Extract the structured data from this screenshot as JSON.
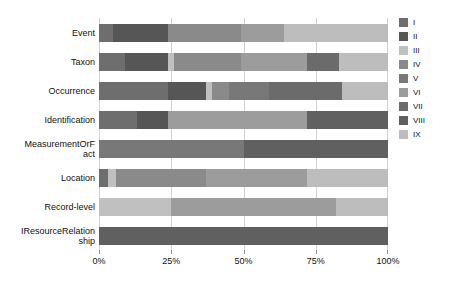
{
  "chart_data": {
    "type": "bar",
    "orientation": "horizontal",
    "stacked": true,
    "normalized": true,
    "title": "",
    "subtitle": "",
    "xlabel": "",
    "ylabel": "",
    "xlim": [
      0,
      100
    ],
    "grid": true,
    "legend_position": "right",
    "xticks": [
      0,
      25,
      50,
      75,
      100
    ],
    "xtick_labels": [
      "0%",
      "25%",
      "50%",
      "75%",
      "100%"
    ],
    "categories": [
      "Event",
      "Taxon",
      "Occurrence",
      "Identification",
      "MeasurementOrFact",
      "Location",
      "Record-level",
      "IResourceRelationship"
    ],
    "category_display": [
      "Event",
      "Taxon",
      "Occurrence",
      "Identification",
      "MeasurementOrF\nact",
      "Location",
      "Record-level",
      "IResourceRelation\nship"
    ],
    "series": [
      {
        "name": "I",
        "color": "#6e6e6e",
        "values": [
          5,
          9,
          24,
          13,
          0,
          3,
          0,
          0
        ]
      },
      {
        "name": "II",
        "color": "#565656",
        "values": [
          19,
          15,
          13,
          11,
          0,
          0,
          0,
          0
        ]
      },
      {
        "name": "III",
        "color": "#c0c0c0",
        "values": [
          0,
          2,
          2,
          0,
          0,
          3,
          25,
          0
        ]
      },
      {
        "name": "IV",
        "color": "#8a8a8a",
        "values": [
          25,
          23,
          6,
          0,
          0,
          31,
          0,
          0
        ]
      },
      {
        "name": "V",
        "color": "#787878",
        "values": [
          0,
          0,
          14,
          0,
          50,
          0,
          0,
          0
        ]
      },
      {
        "name": "VI",
        "color": "#9c9c9c",
        "values": [
          15,
          23,
          0,
          48,
          0,
          35,
          57,
          0
        ]
      },
      {
        "name": "VII",
        "color": "#6b6b6b",
        "values": [
          0,
          11,
          25,
          0,
          0,
          0,
          0,
          0
        ]
      },
      {
        "name": "VIII",
        "color": "#606060",
        "values": [
          0,
          0,
          0,
          28,
          50,
          0,
          0,
          100
        ]
      },
      {
        "name": "IX",
        "color": "#bdbdbd",
        "values": [
          36,
          17,
          16,
          0,
          0,
          28,
          18,
          0
        ]
      }
    ]
  },
  "legend": {
    "items": [
      {
        "label": "I",
        "color": "#6e6e6e"
      },
      {
        "label": "II",
        "color": "#565656"
      },
      {
        "label": "III",
        "color": "#c0c0c0"
      },
      {
        "label": "IV",
        "color": "#8a8a8a"
      },
      {
        "label": "V",
        "color": "#787878"
      },
      {
        "label": "VI",
        "color": "#9c9c9c"
      },
      {
        "label": "VII",
        "color": "#6b6b6b"
      },
      {
        "label": "VIII",
        "color": "#606060"
      },
      {
        "label": "IX",
        "color": "#bdbdbd"
      }
    ]
  },
  "style": {
    "background": "#ffffff",
    "gridline_color": "#d2d2d2",
    "axis_color": "#8c8c8c",
    "text_color": "#111111"
  }
}
